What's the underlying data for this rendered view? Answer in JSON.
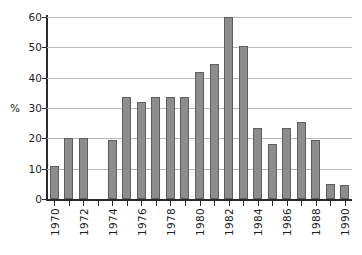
{
  "chart_data": {
    "type": "bar",
    "title": "",
    "subtitle": "",
    "xlabel": "",
    "ylabel": "%",
    "ylim": [
      0,
      60
    ],
    "yticks": [
      0,
      10,
      20,
      30,
      40,
      50,
      60
    ],
    "ytick_labels": [
      "0",
      "10",
      "20",
      "30",
      "40",
      "50",
      "60"
    ],
    "xlim": [
      1969.5,
      1990.5
    ],
    "xtick_labels": [
      "1970",
      "1972",
      "1974",
      "1976",
      "1978",
      "1980",
      "1982",
      "1984",
      "1986",
      "1988",
      "1990"
    ],
    "grid": true,
    "grid_axis": "y",
    "legend": null,
    "categories": [
      "1970",
      "1971",
      "1972",
      "1973",
      "1974",
      "1975",
      "1976",
      "1977",
      "1978",
      "1979",
      "1980",
      "1981",
      "1982",
      "1983",
      "1984",
      "1985",
      "1986",
      "1987",
      "1988",
      "1989",
      "1990"
    ],
    "values": [
      11,
      20,
      20,
      0,
      19.5,
      33.5,
      32,
      33.5,
      33.5,
      33.5,
      42,
      44.5,
      60,
      50.5,
      23.5,
      18,
      23.5,
      25.5,
      19.5,
      5,
      4.5
    ],
    "labeled_ticks": [
      {
        "category": "1970",
        "label": "1970"
      },
      {
        "category": "1972",
        "label": "1972"
      },
      {
        "category": "1974",
        "label": "1974"
      },
      {
        "category": "1976",
        "label": "1976"
      },
      {
        "category": "1978",
        "label": "1978"
      },
      {
        "category": "1980",
        "label": "1980"
      },
      {
        "category": "1982",
        "label": "1982"
      },
      {
        "category": "1984",
        "label": "1984"
      },
      {
        "category": "1986",
        "label": "1986"
      },
      {
        "category": "1988",
        "label": "1988"
      },
      {
        "category": "1990",
        "label": "1990"
      }
    ],
    "colors": {
      "bar_fill": "#8d8d8d",
      "bar_edge": "#5e5e5e",
      "gridline": "#b9b9b9",
      "axis": "#2b2b2b",
      "text": "#1d1d1d",
      "background": "#ffffff"
    }
  }
}
